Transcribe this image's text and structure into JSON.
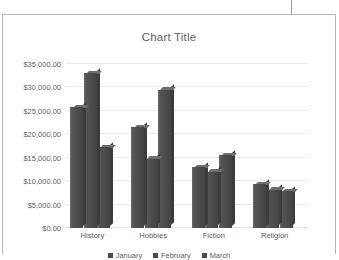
{
  "page": {
    "cursor_line": "text-cursor"
  },
  "chart_data": {
    "type": "bar",
    "title": "Chart Title",
    "xlabel": "",
    "ylabel": "",
    "categories": [
      "History",
      "Hobbies",
      "Fiction",
      "Religion"
    ],
    "series": [
      {
        "name": "January",
        "values": [
          25800,
          21500,
          13000,
          9300
        ]
      },
      {
        "name": "February",
        "values": [
          33000,
          14800,
          12000,
          8200
        ]
      },
      {
        "name": "March",
        "values": [
          17200,
          29500,
          15500,
          7800
        ]
      }
    ],
    "ylim": [
      0,
      35000
    ],
    "ytick_step": 5000,
    "ytick_labels": [
      "$0.00",
      "$5,000.00",
      "$10,000.00",
      "$15,000.00",
      "$20,000.00",
      "$25,000.00",
      "$30,000.00",
      "$35,000.00"
    ],
    "ytick_values": [
      0,
      5000,
      10000,
      15000,
      20000,
      25000,
      30000,
      35000
    ],
    "grid": true,
    "legend_position": "bottom",
    "bar_color": "#4b4b4b",
    "bar_top_color": "#6e6e6e",
    "bar_side_color": "#3c3c3c",
    "gridline_color": "#ededed",
    "title_color": "#5f5f5f",
    "label_color": "#5b5b5b",
    "frame_color": "#b9b9b9"
  }
}
